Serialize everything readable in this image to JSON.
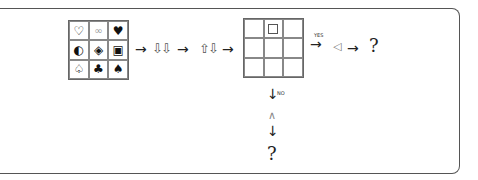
{
  "symbol_grid": {
    "cells": [
      "♡",
      "∞",
      "♥",
      "◐",
      "◈",
      "▣",
      "♤",
      "♣",
      "♠"
    ]
  },
  "flow": {
    "arrow1": "→",
    "hollow_arrows_1": "⇩⇩",
    "arrow2": "→",
    "hollow_arrows_2": "⇧⇩",
    "arrow3": "→"
  },
  "answer_grid": {
    "marked_cell_index": 1,
    "marked_symbol": "□"
  },
  "yes_branch": {
    "label": "YES",
    "arrow": "→",
    "shape": "◁",
    "arrow2": "→",
    "result": "?"
  },
  "no_branch": {
    "label": "NO",
    "arrow": "↓",
    "shape": "∧",
    "arrow2": "↓",
    "result": "?"
  }
}
